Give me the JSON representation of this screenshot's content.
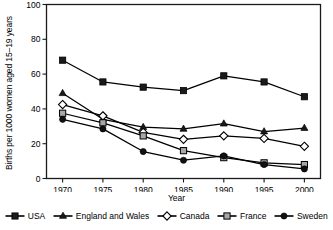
{
  "chart_data": {
    "type": "line",
    "title": "",
    "xlabel": "Year",
    "ylabel": "Births per 1000 women aged 15–19 years",
    "categories": [
      1970,
      1975,
      1980,
      1985,
      1990,
      1995,
      2000
    ],
    "xticklabels": [
      "1970",
      "1975",
      "1980",
      "1985",
      "1990",
      "1995",
      "2000"
    ],
    "yticklabels": [
      "0",
      "20",
      "40",
      "60",
      "80",
      "100"
    ],
    "yticks": [
      0,
      20,
      40,
      60,
      80,
      100
    ],
    "ylim": [
      0,
      100
    ],
    "xlim": [
      1968,
      2002
    ],
    "grid": false,
    "legend_position": "below",
    "series": [
      {
        "name": "USA",
        "marker": "filled-square",
        "color": "#000000",
        "values": [
          68,
          55.5,
          52.5,
          50.5,
          59,
          55.5,
          47
        ]
      },
      {
        "name": "England and Wales",
        "marker": "filled-triangle",
        "color": "#000000",
        "values": [
          49,
          34,
          29.5,
          28.5,
          31.5,
          27,
          29
        ]
      },
      {
        "name": "Canada",
        "marker": "open-diamond",
        "color": "#000000",
        "values": [
          42.5,
          36,
          26.5,
          22.5,
          24.5,
          23,
          18.5
        ]
      },
      {
        "name": "France",
        "marker": "gray-square",
        "color": "#a8a8a8",
        "values": [
          37.5,
          32,
          24.5,
          16,
          12,
          9,
          8
        ]
      },
      {
        "name": "Sweden",
        "marker": "filled-circle",
        "color": "#000000",
        "values": [
          34,
          28.5,
          15.5,
          10.5,
          13,
          8,
          5.5
        ]
      }
    ]
  },
  "legend": {
    "items": [
      {
        "label": "USA",
        "marker": "filled-square"
      },
      {
        "label": "England and Wales",
        "marker": "filled-triangle"
      },
      {
        "label": "Canada",
        "marker": "open-diamond"
      },
      {
        "label": "France",
        "marker": "gray-square"
      },
      {
        "label": "Sweden",
        "marker": "filled-circle"
      }
    ]
  }
}
